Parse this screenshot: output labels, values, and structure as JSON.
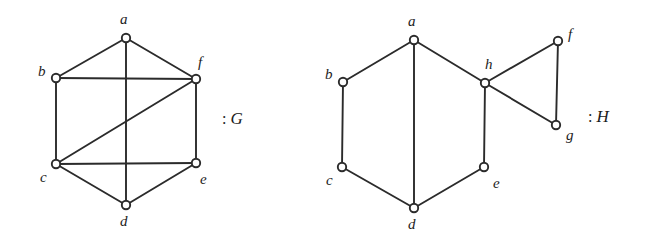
{
  "figure": {
    "width": 646,
    "height": 245,
    "background": "#ffffff",
    "ink_color": "#2b2b2b"
  },
  "graphs": [
    {
      "key": "G",
      "name": "G",
      "colon": ":",
      "caption": ": G",
      "caption_position": {
        "x": 222,
        "y": 110
      },
      "vertices": [
        {
          "id": "a",
          "label": "a",
          "x": 126,
          "y": 38,
          "label_x": 120,
          "label_y": 12
        },
        {
          "id": "b",
          "label": "b",
          "x": 56,
          "y": 78,
          "label_x": 38,
          "label_y": 64
        },
        {
          "id": "f",
          "label": "f",
          "x": 196,
          "y": 79,
          "label_x": 198,
          "label_y": 55
        },
        {
          "id": "c",
          "label": "c",
          "x": 56,
          "y": 164,
          "label_x": 40,
          "label_y": 170
        },
        {
          "id": "e",
          "label": "e",
          "x": 196,
          "y": 163,
          "label_x": 200,
          "label_y": 172
        },
        {
          "id": "d",
          "label": "d",
          "x": 126,
          "y": 205,
          "label_x": 120,
          "label_y": 214
        }
      ],
      "edges": [
        {
          "from": "a",
          "to": "b"
        },
        {
          "from": "a",
          "to": "f"
        },
        {
          "from": "a",
          "to": "d"
        },
        {
          "from": "b",
          "to": "f"
        },
        {
          "from": "b",
          "to": "c"
        },
        {
          "from": "c",
          "to": "f"
        },
        {
          "from": "c",
          "to": "e"
        },
        {
          "from": "c",
          "to": "d"
        },
        {
          "from": "d",
          "to": "e"
        },
        {
          "from": "e",
          "to": "f"
        }
      ]
    },
    {
      "key": "H",
      "name": "H",
      "colon": ":",
      "caption": ": H",
      "caption_position": {
        "x": 588,
        "y": 108
      },
      "vertices": [
        {
          "id": "a",
          "label": "a",
          "x": 414,
          "y": 40,
          "label_x": 408,
          "label_y": 14
        },
        {
          "id": "b",
          "label": "b",
          "x": 343,
          "y": 82,
          "label_x": 325,
          "label_y": 67
        },
        {
          "id": "h",
          "label": "h",
          "x": 485,
          "y": 83,
          "label_x": 485,
          "label_y": 57
        },
        {
          "id": "f",
          "label": "f",
          "x": 558,
          "y": 41,
          "label_x": 568,
          "label_y": 27
        },
        {
          "id": "g",
          "label": "g",
          "x": 556,
          "y": 125,
          "label_x": 566,
          "label_y": 128
        },
        {
          "id": "c",
          "label": "c",
          "x": 342,
          "y": 167,
          "label_x": 326,
          "label_y": 173
        },
        {
          "id": "e",
          "label": "e",
          "x": 484,
          "y": 167,
          "label_x": 493,
          "label_y": 176
        },
        {
          "id": "d",
          "label": "d",
          "x": 414,
          "y": 208,
          "label_x": 408,
          "label_y": 217
        }
      ],
      "edges": [
        {
          "from": "a",
          "to": "b"
        },
        {
          "from": "a",
          "to": "d"
        },
        {
          "from": "a",
          "to": "h"
        },
        {
          "from": "b",
          "to": "c"
        },
        {
          "from": "c",
          "to": "d"
        },
        {
          "from": "d",
          "to": "e"
        },
        {
          "from": "e",
          "to": "h"
        },
        {
          "from": "h",
          "to": "f"
        },
        {
          "from": "h",
          "to": "g"
        },
        {
          "from": "f",
          "to": "g"
        }
      ]
    }
  ]
}
